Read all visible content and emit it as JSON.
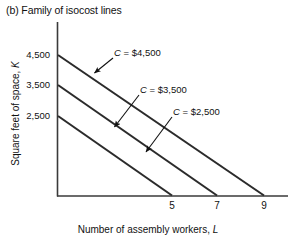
{
  "figure": {
    "title": "(b) Family of isocost lines"
  },
  "axes": {
    "ylabel": "Square feet of space, K",
    "xlabel": "Number of assembly workers, L",
    "yticks": [
      "4,500",
      "3,500",
      "2,500"
    ],
    "xticks": [
      "5",
      "7",
      "9"
    ]
  },
  "annotations": [
    {
      "label": "C = $4,500"
    },
    {
      "label": "C = $3,500"
    },
    {
      "label": "C = $2,500"
    }
  ],
  "colors": {
    "axis": "#3a3a3a",
    "line": "#2b2b2b",
    "text": "#111111"
  },
  "chart_data": {
    "type": "line",
    "title": "(b) Family of isocost lines",
    "xlabel": "Number of assembly workers, L",
    "ylabel": "Square feet of space, K",
    "xlim": [
      0,
      10.5
    ],
    "ylim": [
      0,
      5200
    ],
    "grid": false,
    "legend": "annotated-inline",
    "xticks": [
      5,
      7,
      9
    ],
    "yticks": [
      2500,
      3500,
      4500
    ],
    "series": [
      {
        "name": "C = $4,500",
        "cost": 4500,
        "k_intercept": 4500,
        "l_intercept": 9,
        "x": [
          0,
          9
        ],
        "y": [
          4500,
          0
        ]
      },
      {
        "name": "C = $3,500",
        "cost": 3500,
        "k_intercept": 3500,
        "l_intercept": 7,
        "x": [
          0,
          7
        ],
        "y": [
          3500,
          0
        ]
      },
      {
        "name": "C = $2,500",
        "cost": 2500,
        "k_intercept": 2500,
        "l_intercept": 5,
        "x": [
          0,
          5
        ],
        "y": [
          2500,
          0
        ]
      }
    ],
    "annotations": [
      "C = $4,500",
      "C = $3,500",
      "C = $2,500"
    ]
  }
}
